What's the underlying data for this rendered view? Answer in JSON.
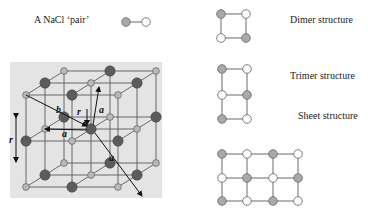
{
  "labels": {
    "pair": {
      "text": "A NaCl ‘pair’",
      "x": 34,
      "y": 15
    },
    "dimer": {
      "text": "Dimer structure",
      "x": 290,
      "y": 15
    },
    "trimer": {
      "text": "Trimer structure",
      "x": 290,
      "y": 71
    },
    "sheet": {
      "text": "Sheet structure",
      "x": 298,
      "y": 111
    }
  },
  "lattice_labels": {
    "r_left": "r",
    "r_center": "r",
    "b": "b",
    "a_top": "a",
    "a_mid": "a",
    "a_diag": "a"
  },
  "colors": {
    "gray_node": "#a9a9a9",
    "gray_node_stroke": "#6f6f6f",
    "white_node": "#ffffff",
    "white_node_stroke": "#6f6f6f",
    "bond": "#777777",
    "lattice_bg": "#e4e4e4",
    "lattice_line": "#5a5a5a",
    "lattice_big_atom": "#5c5c5c",
    "lattice_small_atom": "#b9b9b9"
  },
  "structures": {
    "pair": {
      "nodes": [
        [
          126,
          22,
          "g"
        ],
        [
          146,
          22,
          "w"
        ]
      ],
      "bonds": [
        [
          0,
          1
        ]
      ]
    },
    "dimer": {
      "nodes": [
        [
          221,
          14,
          "g"
        ],
        [
          246,
          14,
          "w"
        ],
        [
          221,
          38,
          "w"
        ],
        [
          246,
          38,
          "g"
        ]
      ],
      "bonds": [
        [
          0,
          1
        ],
        [
          0,
          2
        ],
        [
          1,
          3
        ],
        [
          2,
          3
        ]
      ]
    },
    "trimer": {
      "nodes": [
        [
          222,
          69,
          "g"
        ],
        [
          247,
          69,
          "w"
        ],
        [
          222,
          95,
          "w"
        ],
        [
          247,
          95,
          "g"
        ],
        [
          222,
          119,
          "g"
        ],
        [
          247,
          119,
          "w"
        ]
      ],
      "bonds": [
        [
          0,
          1
        ],
        [
          0,
          2
        ],
        [
          1,
          3
        ],
        [
          2,
          3
        ],
        [
          2,
          4
        ],
        [
          3,
          5
        ],
        [
          4,
          5
        ]
      ]
    },
    "sheet": {
      "cols": [
        222,
        247,
        273,
        298
      ],
      "rows": [
        154,
        178,
        201
      ],
      "pattern": [
        [
          "g",
          "w",
          "g",
          "w"
        ],
        [
          "w",
          "g",
          "w",
          "g"
        ],
        [
          "g",
          "w",
          "g",
          "w"
        ]
      ]
    }
  }
}
